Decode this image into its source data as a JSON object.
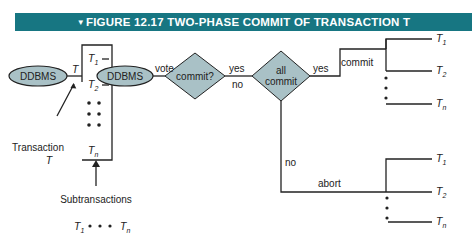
{
  "header": {
    "marker": "▼",
    "title": "FIGURE 12.17 TWO-PHASE COMMIT OF TRANSACTION T",
    "color": "#177682"
  },
  "diagram": {
    "nodes": {
      "ddbms_left": "DDBMS",
      "ddbms_right": "DDBMS",
      "decision_commit": "commit?",
      "decision_all_commit_line1": "all",
      "decision_all_commit_line2": "commit"
    },
    "edges": {
      "transaction_T": "T",
      "vote": "vote",
      "yes1": "yes",
      "no1": "no",
      "yes2": "yes",
      "no2": "no",
      "commit": "commit",
      "abort": "abort"
    },
    "box_items": {
      "t1": "T",
      "t1_sub": "1",
      "t2": "T",
      "t2_sub": "2",
      "tn": "T",
      "tn_sub": "n"
    },
    "annotations": {
      "transaction_line1": "Transaction",
      "transaction_line2": "T",
      "subtransactions": "Subtransactions",
      "seq_start": "T",
      "seq_start_sub": "1",
      "seq_dots": "• • •",
      "seq_end": "T",
      "seq_end_sub": "n"
    },
    "commit_outputs": [
      {
        "label": "T",
        "sub": "1"
      },
      {
        "label": "T",
        "sub": "2"
      },
      {
        "label": "T",
        "sub": "n"
      }
    ],
    "abort_outputs": [
      {
        "label": "T",
        "sub": "1"
      },
      {
        "label": "T",
        "sub": "2"
      },
      {
        "label": "T",
        "sub": "n"
      }
    ],
    "shape_fill": "#a9c1c6"
  }
}
